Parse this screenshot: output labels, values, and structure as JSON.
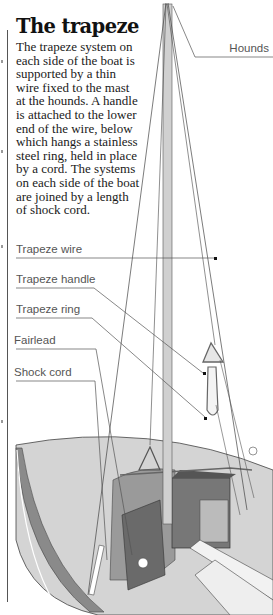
{
  "article": {
    "title": "The trapeze",
    "body": "The trapeze system on each side of the boat is supported by a thin wire fixed to the mast at the hounds. A handle is attached to the lower end of the wire, below which hangs a stainless steel ring, held in place by a cord. The systems on each side of the boat are joined by a length of shock cord."
  },
  "labels": {
    "hounds": "Hounds",
    "trapeze_wire": "Trapeze wire",
    "trapeze_handle": "Trapeze handle",
    "trapeze_ring": "Trapeze ring",
    "fairlead": "Fairlead",
    "shock_cord": "Shock cord"
  },
  "colors": {
    "hull_light": "#d4d4d4",
    "hull_dark": "#8a8a8a",
    "mast": "#d0d0d0",
    "leader_line": "#555555",
    "text": "#1a1a1a"
  }
}
